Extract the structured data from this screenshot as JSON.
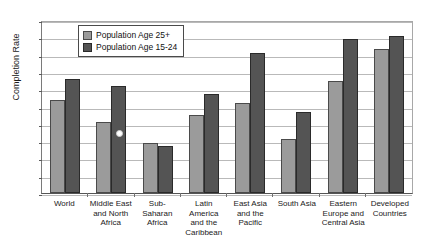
{
  "chart_data": {
    "type": "bar",
    "title": "",
    "xlabel": "",
    "ylabel": "Completion Rate",
    "ylim": [
      0,
      100
    ],
    "ytick_labels": [
      "100",
      "90",
      "80",
      "70",
      "60",
      "50",
      "40",
      "30",
      "20",
      "10",
      "0"
    ],
    "ytick_values": [
      100,
      90,
      80,
      70,
      60,
      50,
      40,
      30,
      20,
      10,
      0
    ],
    "grid": true,
    "legend_position": "top-center",
    "categories": [
      "World",
      "Middle East and North Africa",
      "Sub-Saharan Africa",
      "Latin America and the Caribbean",
      "East Asia and the Pacific",
      "South Asia",
      "Eastern Europe and Central Asia",
      "Developed Countries"
    ],
    "series": [
      {
        "name": "Population Age 25+",
        "color": "#9b9b9b",
        "values": [
          54,
          41,
          29,
          45,
          52,
          31,
          65,
          83
        ]
      },
      {
        "name": "Population Age 15-24",
        "color": "#545454",
        "values": [
          66,
          62,
          27,
          57,
          81,
          47,
          89,
          91
        ]
      }
    ],
    "annotations": [
      {
        "name": "dot-marker",
        "category": "Middle East and North Africa",
        "series": "Population Age 15-24"
      }
    ]
  }
}
